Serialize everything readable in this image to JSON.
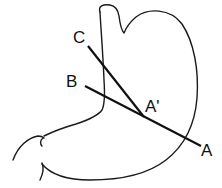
{
  "diagram": {
    "labels": {
      "c": "C",
      "b": "B",
      "a_prime": "A'",
      "a": "A"
    },
    "lines": [
      {
        "name": "line-C-to-A-prime",
        "from": "C",
        "to": "A'"
      },
      {
        "name": "line-B-to-A",
        "from": "B",
        "to": "A",
        "through": "A'"
      }
    ],
    "colors": {
      "stroke": "#111111",
      "background": "#ffffff"
    }
  }
}
